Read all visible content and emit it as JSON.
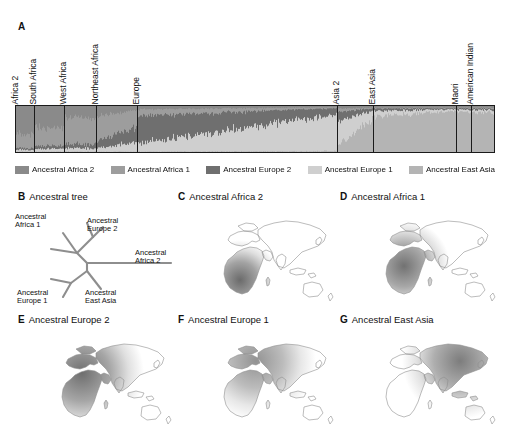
{
  "figure": {
    "background": "#ffffff"
  },
  "panel_a": {
    "letter": "A",
    "populations": [
      {
        "name": "Africa 2",
        "start": 0.0,
        "end": 0.038
      },
      {
        "name": "South Africa",
        "start": 0.038,
        "end": 0.1
      },
      {
        "name": "West Africa",
        "start": 0.1,
        "end": 0.167
      },
      {
        "name": "Northeast Africa",
        "start": 0.167,
        "end": 0.253
      },
      {
        "name": "Europe",
        "start": 0.253,
        "end": 0.672
      },
      {
        "name": "Asia 2",
        "start": 0.672,
        "end": 0.746
      },
      {
        "name": "East Asia",
        "start": 0.746,
        "end": 0.921
      },
      {
        "name": "Maori",
        "start": 0.921,
        "end": 0.952
      },
      {
        "name": "American Indian",
        "start": 0.952,
        "end": 1.0
      }
    ],
    "legend": [
      {
        "label": "Ancestral Africa 2",
        "color": "#8a8a8a"
      },
      {
        "label": "Ancestral Africa 1",
        "color": "#9d9d9d"
      },
      {
        "label": "Ancestral Europe 2",
        "color": "#6f6f6f"
      },
      {
        "label": "Ancestral Europe 1",
        "color": "#cfcfcf"
      },
      {
        "label": "Ancestral East Asia",
        "color": "#b4b4b4"
      }
    ]
  },
  "chart_data": {
    "type": "bar",
    "subtype": "stacked-admixture-structure-plot",
    "xlabel": "",
    "ylabel": "",
    "ylim": [
      0,
      1
    ],
    "grid": false,
    "legend_position": "bottom",
    "categories": [
      "Africa 2",
      "South Africa",
      "West Africa",
      "Northeast Africa",
      "Europe",
      "Asia 2",
      "East Asia",
      "Maori",
      "American Indian"
    ],
    "series": [
      {
        "name": "Ancestral Africa 2",
        "color": "#8a8a8a",
        "values": [
          0.62,
          0.46,
          0.24,
          0.14,
          0.05,
          0.03,
          0.02,
          0.02,
          0.02
        ]
      },
      {
        "name": "Ancestral Africa 1",
        "color": "#9d9d9d",
        "values": [
          0.28,
          0.4,
          0.58,
          0.46,
          0.1,
          0.05,
          0.03,
          0.02,
          0.02
        ]
      },
      {
        "name": "Ancestral Europe 2",
        "color": "#6f6f6f",
        "values": [
          0.04,
          0.06,
          0.09,
          0.24,
          0.38,
          0.14,
          0.05,
          0.03,
          0.03
        ]
      },
      {
        "name": "Ancestral Europe 1",
        "color": "#cfcfcf",
        "values": [
          0.04,
          0.06,
          0.07,
          0.13,
          0.44,
          0.4,
          0.09,
          0.05,
          0.05
        ]
      },
      {
        "name": "Ancestral East Asia",
        "color": "#b4b4b4",
        "values": [
          0.02,
          0.02,
          0.02,
          0.03,
          0.03,
          0.38,
          0.81,
          0.88,
          0.88
        ]
      }
    ]
  },
  "panel_b": {
    "letter": "B",
    "title": "Ancestral tree",
    "tips": [
      {
        "label_line1": "Ancestral",
        "label_line2": "Africa 1"
      },
      {
        "label_line1": "Ancestral",
        "label_line2": "Europe 2"
      },
      {
        "label_line1": "Ancestral",
        "label_line2": "Africa 2"
      },
      {
        "label_line1": "Ancestral",
        "label_line2": "East Asia"
      },
      {
        "label_line1": "Ancestral",
        "label_line2": "Europe 1"
      }
    ]
  },
  "panel_c": {
    "letter": "C",
    "title": "Ancestral Africa 2"
  },
  "panel_d": {
    "letter": "D",
    "title": "Ancestral Africa 1"
  },
  "panel_e": {
    "letter": "E",
    "title": "Ancestral Europe 2"
  },
  "panel_f": {
    "letter": "F",
    "title": "Ancestral Europe 1"
  },
  "panel_g": {
    "letter": "G",
    "title": "Ancestral East Asia"
  }
}
